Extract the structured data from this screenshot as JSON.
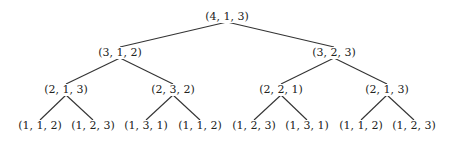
{
  "diagram": {
    "type": "binary-tree",
    "nodes": [
      {
        "id": "n0",
        "label": "(4, 1, 3)",
        "x": 227,
        "y": 17,
        "level": 0
      },
      {
        "id": "n1",
        "label": "(3, 1, 2)",
        "x": 120,
        "y": 53,
        "level": 1
      },
      {
        "id": "n2",
        "label": "(3, 2, 3)",
        "x": 334,
        "y": 53,
        "level": 1
      },
      {
        "id": "n3",
        "label": "(2, 1, 3)",
        "x": 66,
        "y": 90,
        "level": 2
      },
      {
        "id": "n4",
        "label": "(2, 3, 2)",
        "x": 173,
        "y": 90,
        "level": 2
      },
      {
        "id": "n5",
        "label": "(2, 2, 1)",
        "x": 281,
        "y": 90,
        "level": 2
      },
      {
        "id": "n6",
        "label": "(2, 1, 3)",
        "x": 387,
        "y": 90,
        "level": 2
      },
      {
        "id": "n7",
        "label": "(1, 1, 2)",
        "x": 40,
        "y": 126,
        "level": 3
      },
      {
        "id": "n8",
        "label": "(1, 2, 3)",
        "x": 93,
        "y": 126,
        "level": 3
      },
      {
        "id": "n9",
        "label": "(1, 3, 1)",
        "x": 146,
        "y": 126,
        "level": 3
      },
      {
        "id": "n10",
        "label": "(1, 1, 2)",
        "x": 200,
        "y": 126,
        "level": 3
      },
      {
        "id": "n11",
        "label": "(1, 2, 3)",
        "x": 254,
        "y": 126,
        "level": 3
      },
      {
        "id": "n12",
        "label": "(1, 3, 1)",
        "x": 307,
        "y": 126,
        "level": 3
      },
      {
        "id": "n13",
        "label": "(1, 1, 2)",
        "x": 361,
        "y": 126,
        "level": 3
      },
      {
        "id": "n14",
        "label": "(1, 2, 3)",
        "x": 414,
        "y": 126,
        "level": 3
      }
    ],
    "edges": [
      [
        "n0",
        "n1"
      ],
      [
        "n0",
        "n2"
      ],
      [
        "n1",
        "n3"
      ],
      [
        "n1",
        "n4"
      ],
      [
        "n2",
        "n5"
      ],
      [
        "n2",
        "n6"
      ],
      [
        "n3",
        "n7"
      ],
      [
        "n3",
        "n8"
      ],
      [
        "n4",
        "n9"
      ],
      [
        "n4",
        "n10"
      ],
      [
        "n5",
        "n11"
      ],
      [
        "n5",
        "n12"
      ],
      [
        "n6",
        "n13"
      ],
      [
        "n6",
        "n14"
      ]
    ],
    "colors": {
      "edge": "#333333",
      "text": "#222222",
      "background": "#ffffff"
    }
  }
}
